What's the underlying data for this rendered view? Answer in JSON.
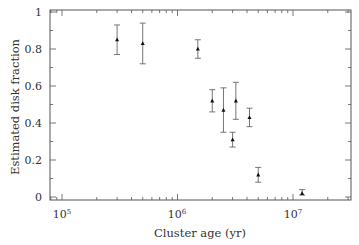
{
  "chart_data": {
    "type": "scatter",
    "title": "",
    "xlabel": "Cluster age (yr)",
    "ylabel": "Estimated disk fraction",
    "xscale": "log",
    "xlim": [
      80000,
      30000000
    ],
    "ylim": [
      0,
      1
    ],
    "x_tick_labels": [
      "10^5",
      "10^6",
      "10^7"
    ],
    "y_tick_labels": [
      "0",
      "0.2",
      "0.4",
      "0.6",
      "0.8",
      "1"
    ],
    "grid": false,
    "legend": null,
    "points": [
      {
        "x": 300000,
        "y": 0.85,
        "err_low": 0.77,
        "err_high": 0.93
      },
      {
        "x": 500000,
        "y": 0.83,
        "err_low": 0.72,
        "err_high": 0.94
      },
      {
        "x": 1500000,
        "y": 0.8,
        "err_low": 0.75,
        "err_high": 0.85
      },
      {
        "x": 2000000,
        "y": 0.52,
        "err_low": 0.46,
        "err_high": 0.58
      },
      {
        "x": 2500000,
        "y": 0.47,
        "err_low": 0.35,
        "err_high": 0.59
      },
      {
        "x": 3000000,
        "y": 0.31,
        "err_low": 0.27,
        "err_high": 0.35
      },
      {
        "x": 3200000,
        "y": 0.52,
        "err_low": 0.42,
        "err_high": 0.62
      },
      {
        "x": 4200000,
        "y": 0.43,
        "err_low": 0.38,
        "err_high": 0.48
      },
      {
        "x": 5000000,
        "y": 0.12,
        "err_low": 0.08,
        "err_high": 0.16
      },
      {
        "x": 12000000,
        "y": 0.02,
        "err_low": 0.01,
        "err_high": 0.04
      }
    ]
  },
  "axes": {
    "x_title": "Cluster age (yr)",
    "y_title": "Estimated disk fraction",
    "x_ticks": [
      {
        "base": "10",
        "exp": "5"
      },
      {
        "base": "10",
        "exp": "6"
      },
      {
        "base": "10",
        "exp": "7"
      }
    ],
    "y_ticks": [
      "0",
      "0.2",
      "0.4",
      "0.6",
      "0.8",
      "1"
    ]
  },
  "colors": {
    "axis": "#555555",
    "marker": "#111111",
    "errorbar": "#666666",
    "text": "#333333"
  }
}
